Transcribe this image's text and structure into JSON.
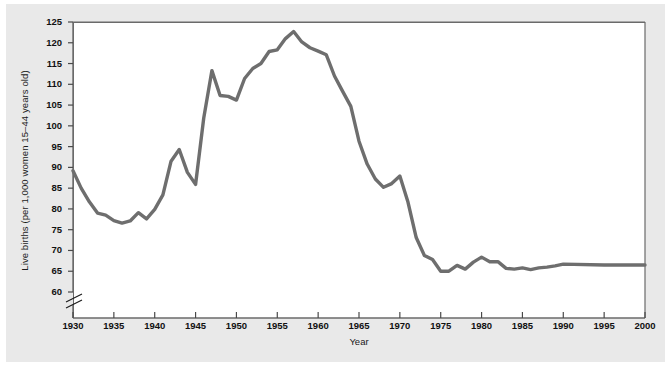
{
  "figure": {
    "background_color": "#e9e9e9",
    "plot_background_color": "#ffffff",
    "axis_color": "#6a6a6a",
    "line_color": "#6e6e6e"
  },
  "axis": {
    "y_tick_labels": [
      "125",
      "120",
      "115",
      "110",
      "105",
      "100",
      "95",
      "90",
      "85",
      "80",
      "75",
      "70",
      "65",
      "60"
    ],
    "x_tick_labels": [
      "1930",
      "1935",
      "1940",
      "1945",
      "1950",
      "1955",
      "1960",
      "1965",
      "1970",
      "1975",
      "1980",
      "1985",
      "1990",
      "1995",
      "2000"
    ],
    "y_axis_break": "axis-break-below-60"
  },
  "chart_data": {
    "type": "line",
    "title": "",
    "xlabel": "Year",
    "ylabel": "Live births (per 1,000 women 15–44 years old)",
    "xlim": [
      1930,
      2000
    ],
    "ylim": [
      58,
      125
    ],
    "grid": false,
    "legend": null,
    "axis_break_y_below": 60,
    "series": [
      {
        "name": "Live births per 1,000 women aged 15-44",
        "x": [
          1930,
          1931,
          1932,
          1933,
          1934,
          1935,
          1936,
          1937,
          1938,
          1939,
          1940,
          1941,
          1942,
          1943,
          1944,
          1945,
          1946,
          1947,
          1948,
          1949,
          1950,
          1951,
          1952,
          1953,
          1954,
          1955,
          1956,
          1957,
          1958,
          1959,
          1960,
          1961,
          1962,
          1963,
          1964,
          1965,
          1966,
          1967,
          1968,
          1969,
          1970,
          1971,
          1972,
          1973,
          1974,
          1975,
          1976,
          1977,
          1978,
          1979,
          1980,
          1981,
          1982,
          1983,
          1984,
          1985,
          1986,
          1987,
          1988,
          1989,
          1990,
          1995,
          2000
        ],
        "values": [
          89.2,
          85.0,
          81.7,
          79.0,
          78.5,
          77.2,
          76.6,
          77.1,
          79.1,
          77.6,
          79.9,
          83.4,
          91.5,
          94.3,
          88.8,
          85.9,
          101.9,
          113.3,
          107.3,
          107.1,
          106.2,
          111.4,
          113.8,
          115.0,
          117.9,
          118.3,
          121.0,
          122.7,
          120.2,
          118.8,
          118.0,
          117.1,
          112.0,
          108.3,
          104.7,
          96.3,
          90.8,
          87.2,
          85.2,
          86.1,
          87.9,
          81.6,
          73.1,
          68.8,
          67.8,
          65.0,
          65.0,
          66.4,
          65.5,
          67.2,
          68.4,
          67.3,
          67.3,
          65.7,
          65.5,
          65.8,
          65.4,
          65.8,
          66.0,
          66.3,
          66.7,
          66.5,
          66.5
        ]
      }
    ],
    "annotations": [
      {
        "label": "1930 level",
        "x": 1930,
        "y": 89.2
      },
      {
        "label": "Depression trough",
        "x": 1936,
        "y": 76.6
      },
      {
        "label": "Wartime peak",
        "x": 1943,
        "y": 94.3
      },
      {
        "label": "Wartime dip",
        "x": 1945,
        "y": 85.9
      },
      {
        "label": "Post-war baby boom surge",
        "x": 1947,
        "y": 113.3
      },
      {
        "label": "Baby boom peak",
        "x": 1957,
        "y": 122.7
      },
      {
        "label": "Baby bust trough",
        "x": 1975,
        "y": 65.0
      },
      {
        "label": "Plateau",
        "x": 2000,
        "y": 66.5
      }
    ]
  }
}
